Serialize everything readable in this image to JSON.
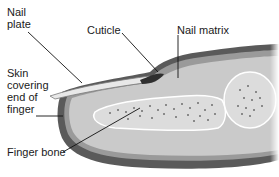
{
  "diagram": {
    "labels": {
      "nail_plate": "Nail\nplate",
      "cuticle": "Cuticle",
      "nail_matrix": "Nail matrix",
      "skin": "Skin\ncovering\nend of\nfinger",
      "finger_bone": "Finger bone"
    },
    "colors": {
      "skin_outer": "#8a8a8a",
      "skin_dark": "#4a4a4a",
      "tissue": "#c9c9c9",
      "bone": "#d8d8d8",
      "bone_dots": "#6e6e6e",
      "nail": "#e6e6e6",
      "leader": "#111111"
    }
  }
}
